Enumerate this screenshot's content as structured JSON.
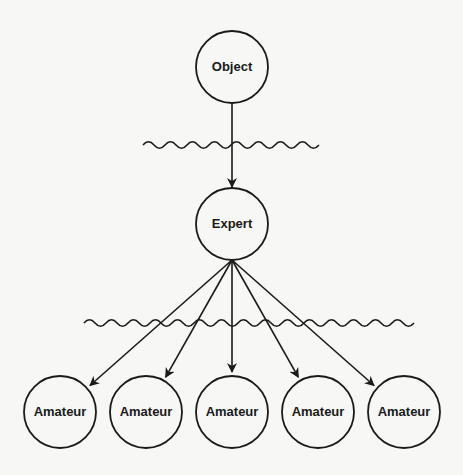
{
  "diagram": {
    "title": "",
    "nodes": {
      "object": {
        "label": "Object",
        "cx": 232,
        "cy": 67
      },
      "expert": {
        "label": "Expert",
        "cx": 232,
        "cy": 224
      },
      "amateurs": [
        {
          "label": "Amateur",
          "cx": 60,
          "cy": 412
        },
        {
          "label": "Amateur",
          "cx": 146,
          "cy": 412
        },
        {
          "label": "Amateur",
          "cx": 232,
          "cy": 412
        },
        {
          "label": "Amateur",
          "cx": 318,
          "cy": 412
        },
        {
          "label": "Amateur",
          "cx": 404,
          "cy": 412
        }
      ]
    },
    "edges": [
      {
        "from": "Object",
        "to": "Expert"
      },
      {
        "from": "Expert",
        "to": "Amateur 1"
      },
      {
        "from": "Expert",
        "to": "Amateur 2"
      },
      {
        "from": "Expert",
        "to": "Amateur 3"
      },
      {
        "from": "Expert",
        "to": "Amateur 4"
      },
      {
        "from": "Expert",
        "to": "Amateur 5"
      }
    ],
    "barriers": [
      {
        "name": "wavy-barrier-upper",
        "x1": 143,
        "x2": 316,
        "y": 145
      },
      {
        "name": "wavy-barrier-lower",
        "x1": 84,
        "x2": 401,
        "y": 323
      }
    ],
    "colors": {
      "stroke": "#1a1a1a",
      "background": "#f7f7f5",
      "node_fill": "#f7f7f5"
    }
  }
}
